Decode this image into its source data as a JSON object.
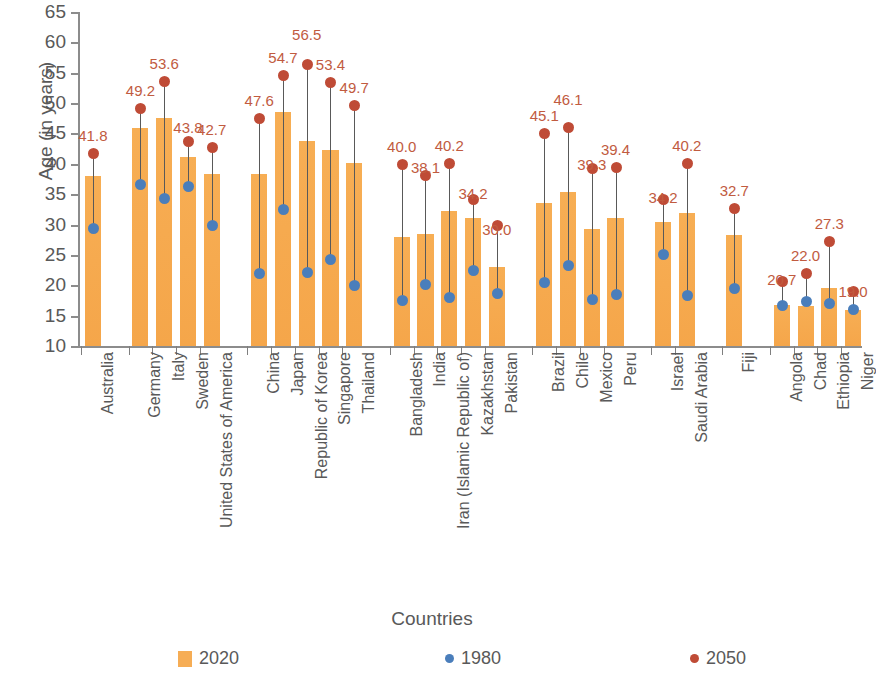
{
  "chart_data": {
    "type": "bar",
    "title": "",
    "xlabel": "Countries",
    "ylabel": "Age (in years)",
    "ylim": [
      10,
      65
    ],
    "yticks": [
      10,
      15,
      20,
      25,
      30,
      35,
      40,
      45,
      50,
      55,
      60,
      65
    ],
    "grid": false,
    "legend_position": "bottom",
    "legend": [
      "2020",
      "1980",
      "2050"
    ],
    "categories": [
      "Australia",
      "Germany",
      "Italy",
      "Sweden",
      "United States of America",
      "China",
      "Japan",
      "Republic of Korea",
      "Singapore",
      "Thailand",
      "Bangladesh",
      "India",
      "Iran (Islamic Republic of)",
      "Kazakhstan",
      "Pakistan",
      "Brazil",
      "Chile",
      "Mexico",
      "Peru",
      "Israel",
      "Saudi Arabia",
      "Fiji",
      "Angola",
      "Chad",
      "Ethiopia",
      "Niger"
    ],
    "group_breaks": [
      1,
      5,
      10,
      15,
      19,
      21,
      22
    ],
    "series": [
      {
        "name": "2020",
        "type": "bar",
        "color": "#F6AD55",
        "values": [
          38.0,
          45.9,
          47.5,
          41.1,
          38.3,
          38.4,
          48.6,
          43.7,
          42.2,
          40.1,
          27.9,
          28.4,
          32.2,
          31.0,
          23.0,
          33.5,
          35.4,
          29.3,
          31.1,
          30.5,
          31.9,
          28.2,
          16.7,
          16.6,
          19.5,
          15.9
        ]
      },
      {
        "name": "1980",
        "type": "scatter",
        "color": "#4A7EBB",
        "values": [
          29.4,
          36.7,
          34.3,
          36.4,
          30.0,
          22.1,
          32.6,
          22.2,
          24.4,
          20.0,
          17.5,
          20.2,
          18.0,
          22.5,
          18.7,
          20.5,
          23.3,
          17.7,
          18.5,
          25.2,
          18.4,
          19.5,
          16.8,
          17.4,
          17.0,
          16.1
        ]
      },
      {
        "name": "2050",
        "type": "scatter",
        "color": "#BF4B36",
        "values": [
          41.8,
          49.2,
          53.6,
          43.8,
          42.7,
          47.6,
          54.7,
          56.5,
          53.4,
          49.7,
          40.0,
          38.1,
          40.2,
          34.2,
          30.0,
          45.1,
          46.1,
          39.3,
          39.4,
          34.2,
          40.2,
          32.7,
          20.7,
          22.0,
          27.3,
          19.0
        ]
      }
    ],
    "data_labels_2050": [
      "41.8",
      "49.2",
      "53.6",
      "43.8",
      "42.7",
      "47.6",
      "54.7",
      "56.5",
      "53.4",
      "49.7",
      "40.0",
      "38.1",
      "40.2",
      "34.2",
      "30.0",
      "45.1",
      "46.1",
      "39.3",
      "39.4",
      "34.2",
      "40.2",
      "32.7",
      "20.7",
      "22.0",
      "27.3",
      "19.0"
    ]
  }
}
